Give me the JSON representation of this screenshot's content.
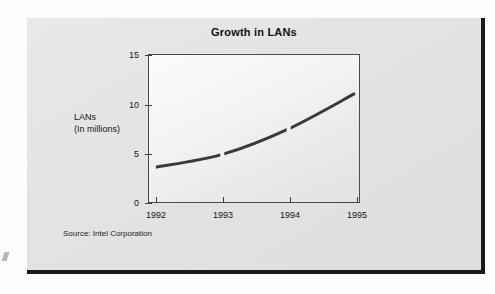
{
  "figure": {
    "title": "Growth in LANs",
    "source_note": "Source: Intel Corporation",
    "y_axis_title_line1": "LANs",
    "y_axis_title_line2": "(In millions)",
    "line_color": "#3a3a3a",
    "panel_color": "#e4e4e4",
    "plot_bg_color": "#f6f6f6",
    "border_color": "#1a1a1a"
  },
  "chart_data": {
    "type": "line",
    "title": "Growth in LANs",
    "xlabel": "",
    "ylabel": "LANs (In millions)",
    "x": [
      "1992",
      "1993",
      "1994",
      "1995"
    ],
    "categories": [
      "1992",
      "1993",
      "1994",
      "1995"
    ],
    "values": [
      3.6,
      4.9,
      7.5,
      11.1
    ],
    "series": [
      {
        "name": "LANs",
        "values": [
          3.6,
          4.9,
          7.5,
          11.1
        ]
      }
    ],
    "xtick_labels": [
      "1992",
      "1993",
      "1994",
      "1995"
    ],
    "ytick_labels": [
      "0",
      "5",
      "10",
      "15"
    ],
    "ytick_values": [
      0,
      5,
      10,
      15
    ],
    "ylim": [
      0,
      15
    ],
    "grid": false,
    "legend": false,
    "annotations": [
      "Source: Intel Corporation"
    ]
  }
}
